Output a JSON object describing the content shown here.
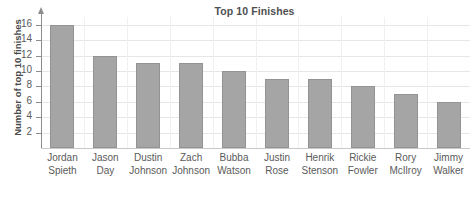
{
  "chart_data": {
    "type": "bar",
    "title": "Top 10 Finishes",
    "xlabel": "",
    "ylabel": "Number of top 10 finishes",
    "categories": [
      "Jordan Spieth",
      "Jason Day",
      "Dustin Johnson",
      "Zach Johnson",
      "Bubba Watson",
      "Justin Rose",
      "Henrik Stenson",
      "Rickie Fowler",
      "Rory McIlroy",
      "Jimmy Walker"
    ],
    "category_lines": [
      [
        "Jordan",
        "Spieth"
      ],
      [
        "Jason",
        "Day"
      ],
      [
        "Dustin",
        "Johnson"
      ],
      [
        "Zach",
        "Johnson"
      ],
      [
        "Bubba",
        "Watson"
      ],
      [
        "Justin",
        "Rose"
      ],
      [
        "Henrik",
        "Stenson"
      ],
      [
        "Rickie",
        "Fowler"
      ],
      [
        "Rory",
        "McIlroy"
      ],
      [
        "Jimmy",
        "Walker"
      ]
    ],
    "values": [
      16,
      12,
      11,
      11,
      10,
      9,
      9,
      8,
      7,
      6
    ],
    "ylim": [
      0,
      17
    ],
    "yticks": [
      2,
      4,
      6,
      8,
      10,
      12,
      14,
      16
    ],
    "ytick_labels": [
      "2",
      "4",
      "6",
      "8",
      "10",
      "12",
      "14",
      "16"
    ],
    "grid": true,
    "legend": false,
    "bar_color": "#a5a5a5",
    "bar_border_color": "#939393",
    "gridline_color": "#e6e6e6",
    "axis_color": "#8d8d8d",
    "title_color": "#4f4f4f",
    "text_color": "#5a5a5a"
  }
}
